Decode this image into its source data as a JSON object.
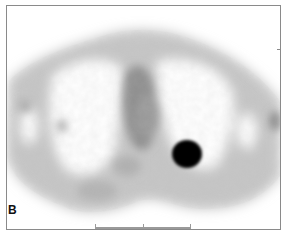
{
  "figure": {
    "panel_label": "B",
    "colors": {
      "background": "#ffffff",
      "tissue_low": "#d4d4d4",
      "tissue_mid": "#a8a8a8",
      "tissue_high": "#707070",
      "lesion": "#000000",
      "frame": "#8a8a8a"
    }
  }
}
